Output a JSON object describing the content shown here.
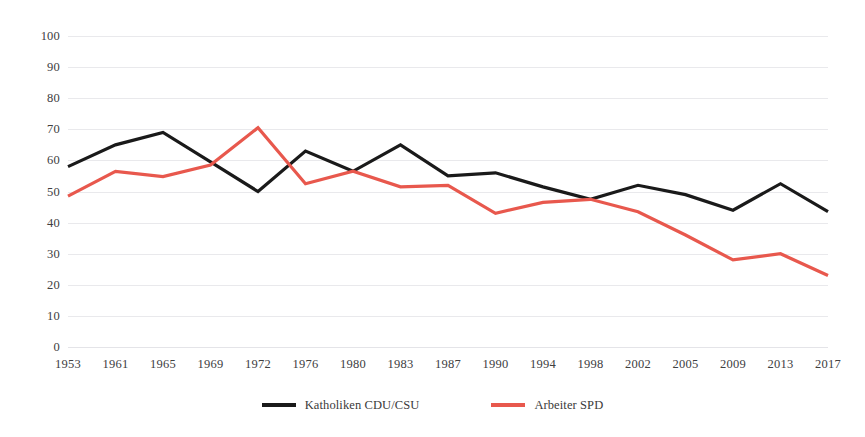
{
  "chart_data": {
    "type": "line",
    "title": "",
    "subtitle": "",
    "xlabel": "",
    "ylabel": "",
    "categories": [
      "1953",
      "1961",
      "1965",
      "1969",
      "1972",
      "1976",
      "1980",
      "1983",
      "1987",
      "1990",
      "1994",
      "1998",
      "2002",
      "2005",
      "2009",
      "2013",
      "2017"
    ],
    "ylim": [
      0,
      100
    ],
    "xlim_categorical": true,
    "yticks": [
      "0",
      "10",
      "20",
      "30",
      "40",
      "50",
      "60",
      "70",
      "80",
      "90",
      "100"
    ],
    "ytick_values": [
      0,
      10,
      20,
      30,
      40,
      50,
      60,
      70,
      80,
      90,
      100
    ],
    "grid": "horizontal",
    "legend_position": "bottom-center",
    "series": [
      {
        "name": "Katholiken CDU/CSU",
        "color": "#1a1a1a",
        "values": [
          58,
          65,
          69,
          59.5,
          50,
          63,
          56.5,
          65,
          55,
          56,
          51.5,
          47.5,
          52,
          49,
          44,
          52.5,
          43.5
        ]
      },
      {
        "name": "Arbeiter SPD",
        "color": "#e8584d",
        "values": [
          48.5,
          56.5,
          54.8,
          58.5,
          70.5,
          52.5,
          56.5,
          51.5,
          52,
          43,
          46.5,
          47.5,
          43.5,
          36,
          28,
          30,
          23
        ]
      }
    ]
  },
  "legend": {
    "items": [
      {
        "label": "Katholiken CDU/CSU",
        "color": "#1a1a1a"
      },
      {
        "label": "Arbeiter SPD",
        "color": "#e8584d"
      }
    ]
  },
  "style": {
    "background": "#ffffff",
    "gridline_color": "#e9e9ec",
    "tick_label_color": "#40403f",
    "line_width": 3.2
  }
}
